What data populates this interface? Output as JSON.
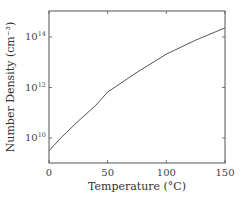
{
  "chart_data": {
    "type": "line",
    "title": "",
    "xlabel": "Temperature (°C)",
    "ylabel": "Number Density (cm⁻³)",
    "yscale": "log",
    "xlim": [
      0,
      150
    ],
    "ylim_log10": [
      9.0,
      15.0
    ],
    "x_ticks": [
      0,
      50,
      100,
      150
    ],
    "x_tick_labels": [
      "0",
      "50",
      "100",
      "150"
    ],
    "y_ticks_log10": [
      10,
      12,
      14
    ],
    "y_tick_labels": [
      {
        "base": "10",
        "exp": "10"
      },
      {
        "base": "10",
        "exp": "12"
      },
      {
        "base": "10",
        "exp": "14"
      }
    ],
    "grid": false,
    "legend": null,
    "series": [
      {
        "name": "Number Density",
        "color": "#555555",
        "x": [
          0,
          10,
          25,
          40,
          50,
          75,
          100,
          125,
          150
        ],
        "values": [
          3100000000.0,
          10000000000.0,
          47000000000.0,
          200000000000.0,
          660000000000.0,
          4000000000000.0,
          21000000000000.0,
          75000000000000.0,
          230000000000000.0
        ]
      }
    ]
  }
}
